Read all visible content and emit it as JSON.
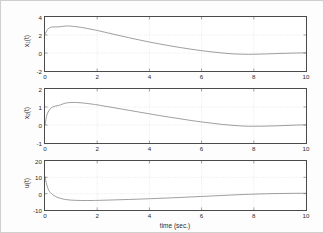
{
  "figure": {
    "background_color": "#ffffff",
    "axis_color": "#4a4a4a",
    "grid_color": "#b9b9b9",
    "curve_color": "#6b6b6b",
    "xlabel": "time (sec.)"
  },
  "chart_data": [
    {
      "type": "line",
      "title": "",
      "panel": 1,
      "xlabel": "",
      "ylabel": "x_1(t)",
      "ylabel_base": "x",
      "ylabel_sub": "1",
      "ylabel_tail": "(t)",
      "xlim": [
        0,
        10
      ],
      "ylim": [
        -2,
        4
      ],
      "xticks": [
        0,
        2,
        4,
        6,
        8,
        10
      ],
      "yticks": [
        -2,
        0,
        2,
        4
      ],
      "grid": true,
      "legend": "none",
      "series": [
        {
          "name": "x1",
          "x": [
            0,
            0.1,
            0.2,
            0.3,
            0.4,
            0.5,
            0.6,
            0.7,
            0.8,
            0.9,
            1.0,
            1.2,
            1.4,
            1.6,
            1.8,
            2.0,
            2.4,
            2.8,
            3.2,
            3.6,
            4.0,
            4.4,
            4.8,
            5.2,
            5.6,
            6.0,
            6.4,
            6.8,
            7.2,
            7.6,
            8.0,
            8.5,
            9.0,
            9.5,
            10.0
          ],
          "y": [
            2.1,
            2.62,
            2.83,
            2.9,
            2.9,
            2.9,
            2.93,
            2.97,
            3.0,
            3.0,
            2.98,
            2.92,
            2.84,
            2.74,
            2.62,
            2.5,
            2.24,
            1.97,
            1.71,
            1.46,
            1.22,
            1.0,
            0.79,
            0.6,
            0.42,
            0.26,
            0.12,
            0.0,
            -0.1,
            -0.14,
            -0.14,
            -0.1,
            -0.05,
            -0.01,
            0.02
          ]
        }
      ]
    },
    {
      "type": "line",
      "title": "",
      "panel": 2,
      "xlabel": "",
      "ylabel": "x_2(t)",
      "ylabel_base": "x",
      "ylabel_sub": "2",
      "ylabel_tail": "(t)",
      "xlim": [
        0,
        10
      ],
      "ylim": [
        -1,
        2
      ],
      "xticks": [
        0,
        2,
        4,
        6,
        8,
        10
      ],
      "yticks": [
        -1,
        0,
        1,
        2
      ],
      "grid": true,
      "legend": "none",
      "series": [
        {
          "name": "x2",
          "x": [
            0,
            0.05,
            0.1,
            0.2,
            0.3,
            0.4,
            0.5,
            0.6,
            0.7,
            0.8,
            0.9,
            1.0,
            1.1,
            1.2,
            1.4,
            1.6,
            1.8,
            2.0,
            2.4,
            2.8,
            3.2,
            3.6,
            4.0,
            4.4,
            4.8,
            5.2,
            5.6,
            6.0,
            6.4,
            6.8,
            7.2,
            7.6,
            8.0,
            8.5,
            9.0,
            9.5,
            10.0
          ],
          "y": [
            0.0,
            0.42,
            0.66,
            0.9,
            1.0,
            1.05,
            1.08,
            1.12,
            1.18,
            1.22,
            1.24,
            1.25,
            1.25,
            1.25,
            1.23,
            1.2,
            1.16,
            1.12,
            1.02,
            0.92,
            0.82,
            0.72,
            0.62,
            0.52,
            0.43,
            0.34,
            0.25,
            0.17,
            0.1,
            0.03,
            -0.02,
            -0.06,
            -0.07,
            -0.06,
            -0.04,
            -0.01,
            0.01
          ]
        }
      ]
    },
    {
      "type": "line",
      "title": "",
      "panel": 3,
      "xlabel": "time (sec.)",
      "ylabel": "u(t)",
      "ylabel_base": "u(t)",
      "ylabel_sub": "",
      "ylabel_tail": "",
      "xlim": [
        0,
        10
      ],
      "ylim": [
        -10,
        20
      ],
      "xticks": [
        0,
        2,
        4,
        6,
        8,
        10
      ],
      "yticks": [
        -10,
        0,
        10,
        20
      ],
      "grid": true,
      "legend": "none",
      "series": [
        {
          "name": "u",
          "x": [
            0,
            0.03,
            0.06,
            0.1,
            0.15,
            0.2,
            0.25,
            0.3,
            0.4,
            0.5,
            0.6,
            0.7,
            0.8,
            1.0,
            1.2,
            1.4,
            1.6,
            1.8,
            2.0,
            2.4,
            2.8,
            3.2,
            3.6,
            4.0,
            4.4,
            4.8,
            5.2,
            5.6,
            6.0,
            6.4,
            6.8,
            7.2,
            7.6,
            8.0,
            8.5,
            9.0,
            9.5,
            10.0
          ],
          "y": [
            10.5,
            8.0,
            6.0,
            3.8,
            1.9,
            0.8,
            0.0,
            -0.7,
            -1.7,
            -2.4,
            -2.9,
            -3.3,
            -3.6,
            -3.95,
            -4.1,
            -4.18,
            -4.2,
            -4.18,
            -4.12,
            -3.95,
            -3.75,
            -3.55,
            -3.35,
            -3.1,
            -2.85,
            -2.6,
            -2.3,
            -2.0,
            -1.7,
            -1.4,
            -1.1,
            -0.8,
            -0.5,
            -0.3,
            -0.05,
            0.1,
            0.2,
            0.25
          ]
        }
      ]
    }
  ]
}
